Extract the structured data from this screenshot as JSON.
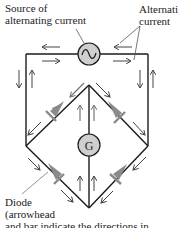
{
  "labels": {
    "source_line1": "Source of",
    "source_line2": "alternating current",
    "alt_line1": "Alternating",
    "alt_line2": "current",
    "diode_line1": "Diode",
    "diode_line2": "(arrowhead",
    "diode_line3": "and bar indicate the directions in"
  },
  "components": {
    "source_symbol": "~",
    "galvanometer": "G"
  },
  "colors": {
    "wire": "#1a1a1a",
    "component_fill": "#cfcfcf",
    "diode": "#8a8a8a",
    "arrow": "#444444"
  }
}
